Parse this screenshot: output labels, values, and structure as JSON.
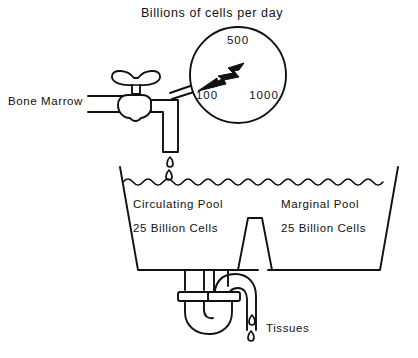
{
  "figure": {
    "title": "Billions of cells per day",
    "background_color": "#ffffff",
    "ink_color": "#111111"
  },
  "gauge": {
    "name": "flow-rate-gauge",
    "tick_top": "500",
    "tick_left": "100",
    "tick_right": "1000",
    "needle_direction": "lower-left",
    "needle_points_to": "100"
  },
  "source": {
    "label": "Bone Marrow",
    "valve_name": "faucet-valve"
  },
  "tank": {
    "left_pool": {
      "name": "Circulating Pool",
      "amount": "25 Billion Cells"
    },
    "right_pool": {
      "name": "Marginal Pool",
      "amount": "25 Billion Cells"
    }
  },
  "outflow": {
    "label": "Tissues",
    "drip_count": 2
  },
  "inflow": {
    "drip_count": 2
  }
}
